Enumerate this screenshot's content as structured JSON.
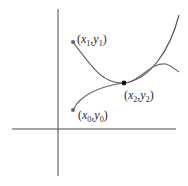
{
  "diagram": {
    "type": "two curves intersecting on cartesian axes",
    "axes": {
      "x_axis": {
        "from": [
          12,
          129
        ],
        "to": [
          176,
          129
        ]
      },
      "y_axis": {
        "from": [
          58,
          9
        ],
        "to": [
          58,
          176
        ]
      },
      "color": "#4a4a4a"
    },
    "curves": [
      {
        "name": "curve-through-x1y1",
        "color": "#555555",
        "path": "M73 42 C 95 72, 105 84, 124 83 C 150 80, 170 50, 179 15"
      },
      {
        "name": "curve-through-x0y0",
        "color": "#555555",
        "path": "M73 110 C 80 95, 100 86, 124 83 C 140 82, 150 62, 166 64 C 172 66, 176 70, 179 72"
      }
    ],
    "points": [
      {
        "id": "p1",
        "label_var": "x",
        "label_sub1": "1",
        "label_var2": "y",
        "label_sub2": "1",
        "x": 73,
        "y": 42,
        "color": "#666666"
      },
      {
        "id": "p0",
        "label_var": "x",
        "label_sub1": "0",
        "label_var2": "y",
        "label_sub2": "0",
        "x": 73,
        "y": 110,
        "color": "#666666"
      },
      {
        "id": "p2",
        "label_var": "x",
        "label_sub1": "2",
        "label_var2": "y",
        "label_sub2": "2",
        "x": 124,
        "y": 83,
        "color": "#111111"
      }
    ],
    "labels": {
      "p1": {
        "open": "(",
        "x": "x",
        "xs": "1",
        "comma": ",",
        "y": "y",
        "ys": "1",
        "close": ")"
      },
      "p0": {
        "open": "(",
        "x": "x",
        "xs": "0",
        "comma": ",",
        "y": "y",
        "ys": "0",
        "close": ")"
      },
      "p2": {
        "open": "(",
        "x": "x",
        "xs": "2",
        "comma": ",",
        "y": "y",
        "ys": "2",
        "close": ")"
      }
    }
  }
}
